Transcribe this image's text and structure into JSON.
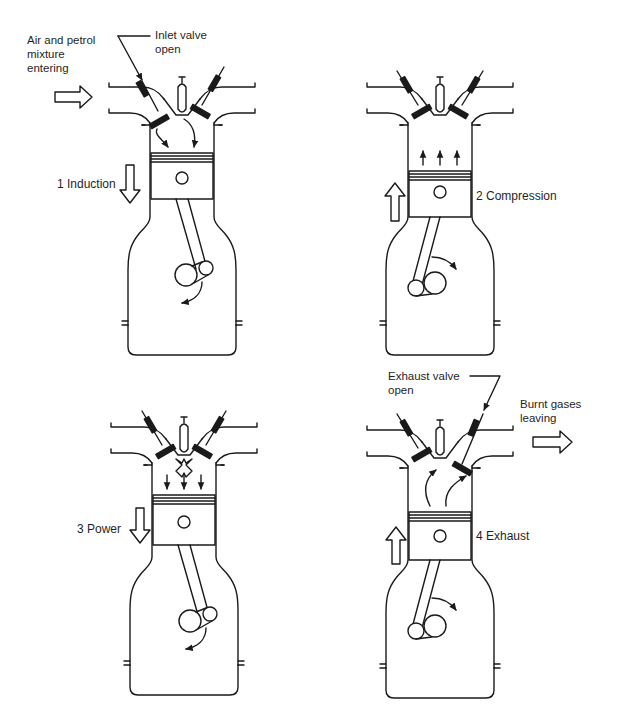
{
  "diagram": {
    "colors": {
      "ink": "#1a1a1a",
      "background": "#ffffff"
    },
    "panels": [
      {
        "id": "induction",
        "stroke_label": "1 Induction",
        "piston_direction": "down",
        "crank_rotation": "counterclockwise-arrow",
        "callouts": [
          {
            "text": "Air and petrol\nmixture\nentering"
          },
          {
            "text": "Inlet valve\nopen"
          }
        ]
      },
      {
        "id": "compression",
        "stroke_label": "2 Compression",
        "piston_direction": "up",
        "crank_rotation": "clockwise-arrow",
        "callouts": []
      },
      {
        "id": "power",
        "stroke_label": "3 Power",
        "piston_direction": "down",
        "crank_rotation": "counterclockwise-arrow",
        "callouts": []
      },
      {
        "id": "exhaust",
        "stroke_label": "4 Exhaust",
        "piston_direction": "up",
        "crank_rotation": "clockwise-arrow",
        "callouts": [
          {
            "text": "Exhaust valve\nopen"
          },
          {
            "text": "Burnt gases\nleaving"
          }
        ]
      }
    ]
  }
}
